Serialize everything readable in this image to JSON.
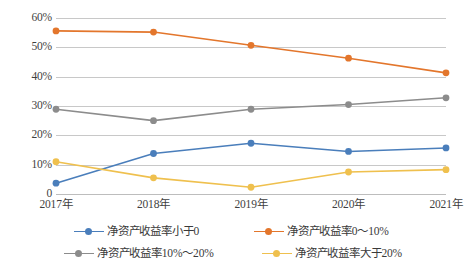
{
  "chart_data": {
    "type": "line",
    "title": "",
    "xlabel": "",
    "ylabel": "",
    "categories": [
      "2017年",
      "2018年",
      "2019年",
      "2020年",
      "2021年"
    ],
    "ylim": [
      0,
      60
    ],
    "ytick_labels": [
      "0",
      "10%",
      "20%",
      "30%",
      "40%",
      "50%",
      "60%"
    ],
    "ytick_values": [
      0,
      10,
      20,
      30,
      40,
      50,
      60
    ],
    "grid": true,
    "legend_position": "bottom",
    "series": [
      {
        "name": "净资产收益率小于0",
        "color": "#4a7ebb",
        "values": [
          3.7,
          13.8,
          17.3,
          14.5,
          15.7
        ]
      },
      {
        "name": "净资产收益率0～10%",
        "color": "#e3762c",
        "values": [
          55.6,
          55.2,
          50.7,
          46.3,
          41.3
        ]
      },
      {
        "name": "净资产收益率10%～20%",
        "color": "#8c8c8c",
        "values": [
          28.9,
          25.0,
          28.9,
          30.5,
          32.8
        ]
      },
      {
        "name": "净资产收益率大于20%",
        "color": "#efc04e",
        "values": [
          11.0,
          5.5,
          2.3,
          7.5,
          8.3
        ]
      }
    ]
  },
  "colors": {
    "gridline": "#c8c8c8",
    "text": "#3a3a3a",
    "background": "#ffffff"
  }
}
